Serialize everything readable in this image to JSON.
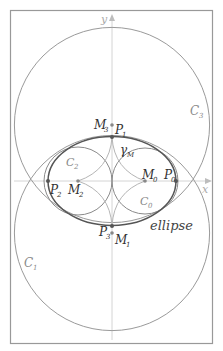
{
  "figure": {
    "axes": {
      "x_label": "x",
      "y_label": "y"
    },
    "curves": {
      "C0": "C",
      "C0_sub": "0",
      "C1": "C",
      "C1_sub": "1",
      "C2": "C",
      "C2_sub": "2",
      "C3": "C",
      "C3_sub": "3",
      "ellipse": "ellipse",
      "gamma": "γ",
      "gamma_sub": "M"
    },
    "points": {
      "M0": "M",
      "M0_sub": "0",
      "M1": "M",
      "M1_sub": "1",
      "M2": "M",
      "M2_sub": "2",
      "M3": "M",
      "M3_sub": "3",
      "P0": "P",
      "P0_sub": "0",
      "P1": "P",
      "P1_sub": "1",
      "P2": "P",
      "P2_sub": "2",
      "P3": "P",
      "P3_sub": "3"
    },
    "colors": {
      "frame": "#8a8a8a",
      "axis": "#c8c8c8",
      "circle": "#9a9a9a",
      "ellipse": "#555555",
      "astroid": "#b0b0b0",
      "label_dark": "#333333",
      "label_gray": "#8a8a8a"
    }
  }
}
